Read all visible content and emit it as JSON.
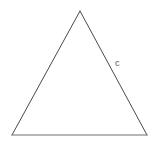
{
  "figure": {
    "kind": "geometry-diagram",
    "shape_name": "triangle",
    "background_color": "#ffffff",
    "stroke_color": "#4a4a4a",
    "base_stroke_color": "#6e6e6e",
    "stroke_width": 1,
    "fill": "none",
    "canvas": {
      "width": 160,
      "height": 144
    },
    "vertices": [
      {
        "name": "apex",
        "x": 80,
        "y": 11
      },
      {
        "name": "bottom-right",
        "x": 147,
        "y": 135
      },
      {
        "name": "bottom-left",
        "x": 12,
        "y": 135
      }
    ],
    "edges": [
      {
        "name": "left-side",
        "from": "apex",
        "to": "bottom-left",
        "label": ""
      },
      {
        "name": "right-side",
        "from": "apex",
        "to": "bottom-right",
        "label": "c"
      },
      {
        "name": "base",
        "from": "bottom-left",
        "to": "bottom-right",
        "label": ""
      }
    ],
    "labels": [
      {
        "id": "c",
        "text": "c",
        "edge": "right-side",
        "color": "#595959",
        "x": 115,
        "y": 59,
        "font_size": 9
      }
    ]
  }
}
